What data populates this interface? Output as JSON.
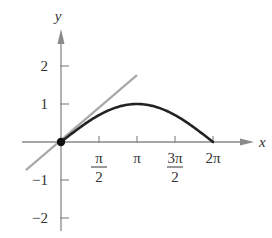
{
  "chart_data": {
    "type": "line",
    "title": "",
    "xlabel": "x",
    "ylabel": "y",
    "x_ticks": [
      {
        "value": 1.5708,
        "label_num": "π",
        "label_den": "2"
      },
      {
        "value": 3.1416,
        "label": "π"
      },
      {
        "value": 4.7124,
        "label_num": "3π",
        "label_den": "2"
      },
      {
        "value": 6.2832,
        "label": "2π"
      }
    ],
    "y_ticks": [
      {
        "value": 2,
        "label": "2"
      },
      {
        "value": 1,
        "label": "1"
      },
      {
        "value": -1,
        "label": "−1"
      },
      {
        "value": -2,
        "label": "−2"
      }
    ],
    "xlim": [
      -1.4,
      7.8
    ],
    "ylim": [
      -2.4,
      3.0
    ],
    "grid": false,
    "series": [
      {
        "name": "curve y = sin(x/2)",
        "color": "#222222",
        "x": [
          0,
          0.785,
          1.571,
          2.356,
          3.142,
          3.927,
          4.712,
          5.498,
          6.283
        ],
        "y": [
          0,
          0.383,
          0.707,
          0.924,
          1.0,
          0.924,
          0.707,
          0.383,
          0
        ]
      },
      {
        "name": "tangent line y = x/2",
        "color": "#a8a8a8",
        "x": [
          -1.45,
          3.14
        ],
        "y": [
          -0.74,
          1.76
        ]
      }
    ],
    "points": [
      {
        "name": "origin point",
        "x": 0,
        "y": 0,
        "color": "#111111"
      }
    ],
    "colors": {
      "axis": "#8a8a8a",
      "curve": "#222222",
      "tangent": "#a8a8a8",
      "text": "#333333"
    }
  }
}
